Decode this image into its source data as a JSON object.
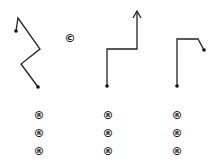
{
  "diagram": {
    "center_symbol": "©",
    "stroke_color": "#222222",
    "paths": [
      {
        "name": "zigzag-path",
        "points": [
          [
            16,
            31
          ],
          [
            18,
            18
          ],
          [
            40,
            49
          ],
          [
            21,
            64
          ],
          [
            38,
            87
          ]
        ],
        "start_dot": [
          16,
          31
        ],
        "end_dot": [
          38,
          87
        ],
        "arrow": false
      },
      {
        "name": "step-arrow-path",
        "points": [
          [
            107,
            86
          ],
          [
            107,
            49
          ],
          [
            137,
            49
          ],
          [
            137,
            12
          ]
        ],
        "start_dot": [
          107,
          86
        ],
        "arrow": true
      },
      {
        "name": "hook-path",
        "points": [
          [
            177,
            86
          ],
          [
            177,
            39
          ],
          [
            198,
            39
          ],
          [
            204,
            50
          ]
        ],
        "start_dot": [
          177,
          86
        ],
        "end_dot": [
          204,
          50
        ],
        "arrow": false
      }
    ],
    "columns": [
      {
        "symbols": [
          "®",
          "®",
          "®"
        ]
      },
      {
        "symbols": [
          "®",
          "®",
          "®"
        ]
      },
      {
        "symbols": [
          "®",
          "®",
          "®"
        ]
      }
    ]
  }
}
